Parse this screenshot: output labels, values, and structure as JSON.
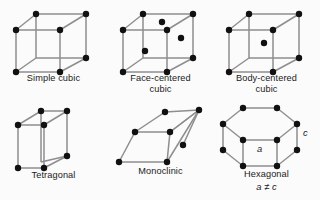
{
  "figure": {
    "background_color": "#fbfbfb",
    "edge_color": "#8e8e8e",
    "vertex_color": "#111111",
    "text_color": "#1a1a1a"
  },
  "cells": [
    {
      "id": "simple-cubic",
      "label_line1": "Simple cubic",
      "label_line2": "",
      "note": "",
      "vertex_count": 8,
      "interior_points": 0,
      "face_points": 0
    },
    {
      "id": "face-centered-cubic",
      "label_line1": "Face-centered",
      "label_line2": "cubic",
      "note": "",
      "vertex_count": 8,
      "interior_points": 0,
      "face_points": 3
    },
    {
      "id": "body-centered-cubic",
      "label_line1": "Body-centered",
      "label_line2": "cubic",
      "note": "",
      "vertex_count": 8,
      "interior_points": 1,
      "face_points": 0
    },
    {
      "id": "tetragonal",
      "label_line1": "Tetragonal",
      "label_line2": "",
      "note": "",
      "vertex_count": 8,
      "interior_points": 0,
      "face_points": 0
    },
    {
      "id": "monoclinic",
      "label_line1": "Monoclinic",
      "label_line2": "",
      "note": "",
      "vertex_count": 8,
      "interior_points": 0,
      "face_points": 0
    },
    {
      "id": "hexagonal",
      "label_line1": "Hexagonal",
      "label_line2": "",
      "note": "a ≠ c",
      "vertex_count": 12,
      "interior_points": 0,
      "face_points": 0,
      "axis_label_a": "a",
      "axis_label_c": "c"
    }
  ]
}
